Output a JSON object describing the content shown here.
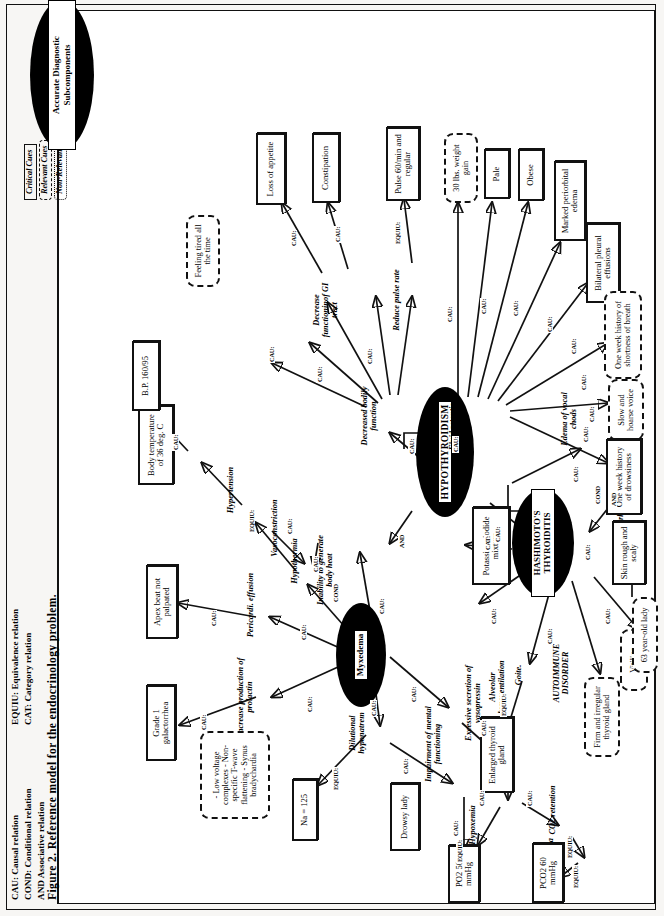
{
  "figure": {
    "caption": "Figure 2.   Reference model for the endocrinology problem.",
    "key_oval_label": "Accurate Diagnostic Subcomponents",
    "cue_key": [
      {
        "name": "critical-cue",
        "label": "Critical Cues",
        "style": "solid"
      },
      {
        "name": "relevant-cue",
        "label": "Relevant Cues",
        "style": "dashed"
      },
      {
        "name": "non-relevant-cue",
        "label": "Non-Relevant Cues",
        "style": "dotted"
      }
    ],
    "relation_legend": [
      "CAU: Causal relation",
      "COND: Conditional relation",
      "AND Associative relation",
      "EQUIU: Equivalence relation",
      "CAT: Category relation"
    ]
  },
  "diagnoses": [
    {
      "name": "hypothyroidism",
      "label": "HYPOTHYROIDISM"
    },
    {
      "name": "myxedema",
      "label": "Myxedema"
    },
    {
      "name": "hashimotos-thyroiditis",
      "label": "HASHIMOTO'S THYROIDITIS"
    }
  ],
  "intermediates": [
    {
      "name": "increase-production-of-prolactin",
      "label": "Increase production of prolactin"
    },
    {
      "name": "pericardial-effusion",
      "label": "Pericardi. effusion"
    },
    {
      "name": "dilutional-hyponatremia",
      "label": "Dilutional hyponatrem"
    },
    {
      "name": "impairment-of-mental-functioning",
      "label": "Impairment of mental functioning"
    },
    {
      "name": "excessive-secretion-of-vasopressin",
      "label": "Excessive secretion of vasopressin"
    },
    {
      "name": "hypothermia",
      "label": "Hypothermia"
    },
    {
      "name": "hypertension",
      "label": "Hypertension"
    },
    {
      "name": "vasoconstriction",
      "label": "Vasoconstriction"
    },
    {
      "name": "inability-to-generate-body-heat",
      "label": "Inability to generate body heat"
    },
    {
      "name": "decreased-bodily-function",
      "label": "Decreased bodily function"
    },
    {
      "name": "decrease-functionin-of-gi-tract",
      "label": "Decrease functioninof GI tract"
    },
    {
      "name": "reduce-pulse-rate",
      "label": "Reduce pulse rate"
    },
    {
      "name": "fluid-retention",
      "label": "Fluid retention"
    },
    {
      "name": "alveolar-hypoventilation",
      "label": "Alveolar hypoventilation"
    },
    {
      "name": "autoimmune-disorder",
      "label": "AUTOIMMUNE DISORDER"
    },
    {
      "name": "respiratory-failure",
      "label": "Respiratory failure"
    },
    {
      "name": "hypoxemia",
      "label": "Hypoxemia"
    },
    {
      "name": "co2-retention",
      "label": "CO2 retention"
    },
    {
      "name": "hypercabia",
      "label": "Hypercabia"
    },
    {
      "name": "goite",
      "label": "Goite."
    },
    {
      "name": "hyperkeratosis",
      "label": "Hyperkeratosis"
    },
    {
      "name": "edema-of-vocal-chods",
      "label": "Edema of vocal chods"
    }
  ],
  "cues": [
    {
      "name": "grade-1-galactorrhea",
      "label": "Grade 1 galactorrhea",
      "type": "critical"
    },
    {
      "name": "apex-beat-not-palpated",
      "label": "Apex beat not palpated",
      "type": "critical"
    },
    {
      "name": "ecg-findings",
      "label": "- Low voltage complexes - Non-specific T-wave flattening - Synus bradychardia",
      "type": "relevant"
    },
    {
      "name": "na-125",
      "label": "Na = 125",
      "type": "critical"
    },
    {
      "name": "drowsy-lady",
      "label": "Drowsy lady",
      "type": "critical"
    },
    {
      "name": "po2-50",
      "label": "PO2 50 mmHg",
      "type": "critical"
    },
    {
      "name": "pco2-60",
      "label": "PCO2 60 mmHg",
      "type": "critical"
    },
    {
      "name": "body-temperature",
      "label": "Body temperature of 36 deg. C",
      "type": "critical"
    },
    {
      "name": "bp-160-95",
      "label": "B.P. 160/95",
      "type": "critical"
    },
    {
      "name": "feeling-tired-all-the-time",
      "label": "Feeling tired all the time",
      "type": "relevant"
    },
    {
      "name": "loss-of-appetite",
      "label": "Loss of appetite",
      "type": "critical"
    },
    {
      "name": "constipation",
      "label": "Constipation",
      "type": "critical"
    },
    {
      "name": "pulse-60-min",
      "label": "Pulse 60/min and regular",
      "type": "critical"
    },
    {
      "name": "weight-gain-30lbs",
      "label": "30 lbs. weight gain",
      "type": "relevant"
    },
    {
      "name": "pale",
      "label": "Pale",
      "type": "critical"
    },
    {
      "name": "obese",
      "label": "Obese",
      "type": "critical"
    },
    {
      "name": "marked-periorbital-edema",
      "label": "Marked periorbital edema",
      "type": "critical"
    },
    {
      "name": "bilateral-pleural-effusions",
      "label": "Bilateral pleural effusions",
      "type": "critical"
    },
    {
      "name": "one-week-history-shortness-of-breath",
      "label": "One week history of shortness of breath",
      "type": "relevant"
    },
    {
      "name": "slow-and-hoarse-voice",
      "label": "Slow and hoarse voice",
      "type": "relevant"
    },
    {
      "name": "one-week-history-of-drowsiness",
      "label": "One week history of drowsiness",
      "type": "critical"
    },
    {
      "name": "skin-rough-and-scaly",
      "label": "Skin rough and scaly",
      "type": "critical"
    },
    {
      "name": "potassium-iodide-mixture",
      "label": "Potassium iodide mixture",
      "type": "critical"
    },
    {
      "name": "enlarged-thyroid-gland",
      "label": "Enlarged thyroid gland",
      "type": "critical"
    },
    {
      "name": "firm-and-irregular-thyroid-gland",
      "label": "Firm and irregular thyroid gland",
      "type": "relevant"
    },
    {
      "name": "vitiligo",
      "label": "Vitiligo",
      "type": "relevant"
    },
    {
      "name": "63-year-old-lady",
      "label": "63 year-old lady",
      "type": "relevant"
    }
  ],
  "relations": {
    "cau": "CAU:",
    "cond": "COND",
    "and": "AND",
    "equiv": "EQUIU:",
    "cat": "CAT:"
  }
}
